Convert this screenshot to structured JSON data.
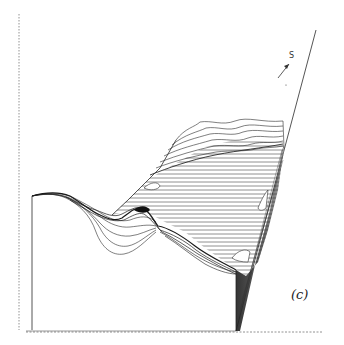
{
  "figure": {
    "panel_label": "(c)",
    "direction_label": "S",
    "colors": {
      "ink": "#2a2a2a",
      "axis": "#777777",
      "shade": "#3a3a3a",
      "background": "#ffffff"
    }
  }
}
